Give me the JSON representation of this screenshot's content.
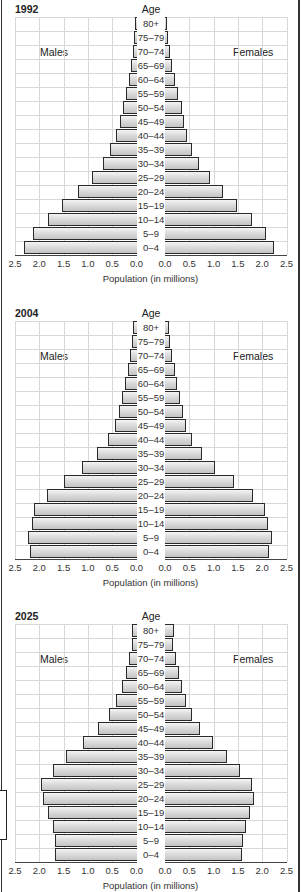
{
  "figure": {
    "age_axis_title": "Age",
    "males_label": "Males",
    "females_label": "Females",
    "x_axis_title": "Population (in millions)",
    "male_ticks": [
      "2.5",
      "2.0",
      "1.5",
      "1.0",
      "0.5",
      "0.0"
    ],
    "female_ticks": [
      "0.0",
      "0.5",
      "1.0",
      "1.5",
      "2.0",
      "2.5"
    ],
    "age_groups": [
      "80+",
      "75–79",
      "70–74",
      "65–69",
      "60–64",
      "55–59",
      "50–54",
      "45–49",
      "40–44",
      "35–39",
      "30–34",
      "25–29",
      "20–24",
      "15–19",
      "10–14",
      "5–9",
      "0–4"
    ]
  },
  "chart_data": [
    {
      "type": "bar",
      "subtype": "population-pyramid",
      "title": "1992",
      "xlabel": "Population (in millions)",
      "ylabel": "Age",
      "xlim": [
        0,
        2.5
      ],
      "grid": true,
      "categories": [
        "80+",
        "75–79",
        "70–74",
        "65–69",
        "60–64",
        "55–59",
        "50–54",
        "45–49",
        "40–44",
        "35–39",
        "30–34",
        "25–29",
        "20–24",
        "15–19",
        "10–14",
        "5–9",
        "0–4"
      ],
      "series": [
        {
          "name": "Males",
          "values": [
            0.04,
            0.06,
            0.08,
            0.12,
            0.16,
            0.22,
            0.29,
            0.35,
            0.43,
            0.55,
            0.7,
            0.93,
            1.22,
            1.54,
            1.84,
            2.13,
            2.32
          ]
        },
        {
          "name": "Females",
          "values": [
            0.04,
            0.06,
            0.1,
            0.14,
            0.2,
            0.27,
            0.35,
            0.4,
            0.46,
            0.56,
            0.69,
            0.92,
            1.19,
            1.49,
            1.8,
            2.07,
            2.24
          ]
        }
      ]
    },
    {
      "type": "bar",
      "subtype": "population-pyramid",
      "title": "2004",
      "xlabel": "Population (in millions)",
      "ylabel": "Age",
      "xlim": [
        0,
        2.5
      ],
      "grid": true,
      "categories": [
        "80+",
        "75–79",
        "70–74",
        "65–69",
        "60–64",
        "55–59",
        "50–54",
        "45–49",
        "40–44",
        "35–39",
        "30–34",
        "25–29",
        "20–24",
        "15–19",
        "10–14",
        "5–9",
        "0–4"
      ],
      "series": [
        {
          "name": "Males",
          "values": [
            0.08,
            0.1,
            0.14,
            0.18,
            0.25,
            0.31,
            0.37,
            0.45,
            0.59,
            0.82,
            1.13,
            1.5,
            1.86,
            2.11,
            2.17,
            2.25,
            2.21
          ]
        },
        {
          "name": "Females",
          "values": [
            0.08,
            0.1,
            0.14,
            0.2,
            0.25,
            0.31,
            0.37,
            0.43,
            0.55,
            0.76,
            1.03,
            1.41,
            1.81,
            2.06,
            2.12,
            2.2,
            2.14
          ]
        }
      ]
    },
    {
      "type": "bar",
      "subtype": "population-pyramid",
      "title": "2025",
      "xlabel": "Population (in millions)",
      "ylabel": "Age",
      "xlim": [
        0,
        2.5
      ],
      "grid": true,
      "categories": [
        "80+",
        "75–79",
        "70–74",
        "65–69",
        "60–64",
        "55–59",
        "50–54",
        "45–49",
        "40–44",
        "35–39",
        "30–34",
        "25–29",
        "20–24",
        "15–19",
        "10–14",
        "5–9",
        "0–4"
      ],
      "series": [
        {
          "name": "Males",
          "values": [
            0.1,
            0.1,
            0.16,
            0.22,
            0.3,
            0.43,
            0.57,
            0.8,
            1.12,
            1.47,
            1.72,
            1.97,
            1.93,
            1.83,
            1.72,
            1.68,
            1.68
          ]
        },
        {
          "name": "Females",
          "values": [
            0.18,
            0.17,
            0.23,
            0.29,
            0.35,
            0.44,
            0.56,
            0.73,
            0.98,
            1.27,
            1.55,
            1.79,
            1.83,
            1.75,
            1.67,
            1.61,
            1.59
          ]
        }
      ]
    }
  ]
}
